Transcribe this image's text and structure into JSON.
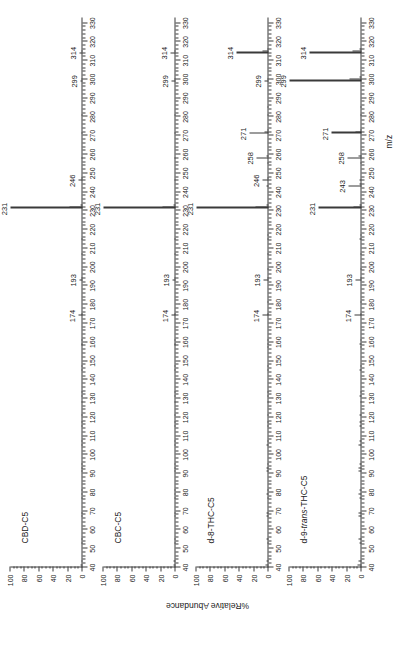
{
  "figure": {
    "axis_y_title": "%Relative Abundance",
    "axis_x_title": "m/z",
    "x_min": 40,
    "x_max": 333,
    "y_min": 0,
    "y_max": 100,
    "x_major_ticks": [
      40,
      50,
      60,
      70,
      80,
      90,
      100,
      110,
      120,
      130,
      140,
      150,
      160,
      170,
      180,
      190,
      200,
      210,
      220,
      230,
      240,
      250,
      260,
      270,
      280,
      290,
      300,
      310,
      320,
      330
    ],
    "y_major_ticks": [
      0,
      20,
      40,
      60,
      80,
      100
    ],
    "ink_color": "#3a3a3a"
  },
  "chart_data": [
    {
      "type": "bar",
      "title": "CBD-C5",
      "xlabel": "m/z",
      "ylabel": "%Relative Abundance",
      "xlim": [
        40,
        333
      ],
      "ylim": [
        0,
        100
      ],
      "grid": false,
      "legend": "none",
      "labeled_peaks": [
        174,
        193,
        231,
        246,
        299,
        314
      ],
      "x": [
        41,
        43,
        53,
        55,
        67,
        69,
        77,
        79,
        81,
        91,
        93,
        95,
        105,
        107,
        115,
        117,
        121,
        128,
        131,
        133,
        145,
        147,
        158,
        159,
        161,
        174,
        175,
        193,
        194,
        207,
        215,
        231,
        232,
        233,
        246,
        247,
        258,
        271,
        281,
        299,
        300,
        314,
        315
      ],
      "y": [
        2.5,
        2.0,
        1.2,
        1.5,
        1.2,
        1.5,
        1.0,
        1.2,
        1.0,
        1.4,
        1.2,
        1.0,
        1.2,
        1.0,
        1.0,
        0.9,
        0.9,
        0.8,
        0.9,
        0.8,
        0.9,
        0.8,
        0.8,
        0.9,
        0.8,
        5.0,
        1.0,
        4.0,
        0.8,
        0.9,
        0.8,
        100,
        18,
        2.5,
        6.0,
        1.0,
        0.8,
        0.9,
        0.8,
        3.0,
        0.8,
        4.5,
        0.8
      ]
    },
    {
      "type": "bar",
      "title": "CBC-C5",
      "xlabel": "m/z",
      "ylabel": "%Relative Abundance",
      "xlim": [
        40,
        333
      ],
      "ylim": [
        0,
        100
      ],
      "grid": false,
      "legend": "none",
      "labeled_peaks": [
        174,
        193,
        231,
        299,
        314
      ],
      "x": [
        41,
        43,
        53,
        55,
        67,
        69,
        77,
        79,
        81,
        91,
        93,
        95,
        105,
        107,
        115,
        117,
        121,
        128,
        131,
        133,
        145,
        147,
        158,
        159,
        161,
        174,
        175,
        193,
        194,
        207,
        215,
        231,
        232,
        233,
        246,
        258,
        271,
        281,
        299,
        300,
        314,
        315
      ],
      "y": [
        2.5,
        2.2,
        1.2,
        1.5,
        1.2,
        1.5,
        1.0,
        1.2,
        1.0,
        1.4,
        1.2,
        1.0,
        1.2,
        1.0,
        1.0,
        0.9,
        0.9,
        0.8,
        0.9,
        0.8,
        0.9,
        0.8,
        0.8,
        0.9,
        0.8,
        5.5,
        1.0,
        4.5,
        0.8,
        0.9,
        0.8,
        100,
        18,
        2.5,
        1.0,
        0.9,
        1.0,
        0.8,
        5.0,
        1.0,
        7.0,
        1.0
      ]
    },
    {
      "type": "bar",
      "title": "d-8-THC-C5",
      "xlabel": "m/z",
      "ylabel": "%Relative Abundance",
      "xlim": [
        40,
        333
      ],
      "ylim": [
        0,
        100
      ],
      "grid": false,
      "legend": "none",
      "labeled_peaks": [
        174,
        193,
        231,
        246,
        258,
        271,
        299,
        314
      ],
      "x": [
        41,
        43,
        53,
        55,
        67,
        69,
        77,
        79,
        81,
        91,
        93,
        95,
        105,
        107,
        115,
        117,
        121,
        128,
        131,
        133,
        145,
        147,
        157,
        159,
        161,
        174,
        175,
        181,
        193,
        194,
        199,
        207,
        215,
        217,
        231,
        232,
        233,
        243,
        246,
        247,
        255,
        258,
        259,
        271,
        272,
        273,
        281,
        285,
        299,
        300,
        314,
        315,
        316
      ],
      "y": [
        3.5,
        3.0,
        2.0,
        2.5,
        2.5,
        3.0,
        2.0,
        2.5,
        2.0,
        3.0,
        2.5,
        2.0,
        2.5,
        2.0,
        2.0,
        1.8,
        1.8,
        1.5,
        1.8,
        1.5,
        1.8,
        1.5,
        1.5,
        2.0,
        1.5,
        8.0,
        1.5,
        1.5,
        6.5,
        1.2,
        1.2,
        1.5,
        1.5,
        1.2,
        100,
        18,
        3.0,
        2.5,
        8.0,
        1.5,
        1.5,
        16,
        2.5,
        27,
        5.0,
        1.5,
        1.5,
        1.2,
        6.0,
        1.2,
        45,
        8.0,
        1.5
      ]
    },
    {
      "type": "bar",
      "title": "d-9-trans-THC-C5",
      "title_italic_part": "trans",
      "xlabel": "m/z",
      "ylabel": "%Relative Abundance",
      "xlim": [
        40,
        333
      ],
      "ylim": [
        0,
        100
      ],
      "grid": false,
      "legend": "none",
      "labeled_peaks": [
        174,
        193,
        231,
        243,
        258,
        271,
        299,
        314
      ],
      "x": [
        41,
        43,
        53,
        55,
        67,
        69,
        77,
        79,
        81,
        91,
        93,
        95,
        105,
        107,
        115,
        117,
        121,
        128,
        131,
        133,
        145,
        147,
        157,
        159,
        161,
        174,
        175,
        181,
        193,
        194,
        199,
        207,
        215,
        217,
        231,
        232,
        233,
        243,
        244,
        246,
        255,
        258,
        259,
        271,
        272,
        273,
        281,
        285,
        299,
        300,
        301,
        314,
        315,
        316
      ],
      "y": [
        5.0,
        4.5,
        3.0,
        3.5,
        3.5,
        4.0,
        3.0,
        3.5,
        3.0,
        4.0,
        3.5,
        3.0,
        3.5,
        3.0,
        3.0,
        2.5,
        2.5,
        2.0,
        2.5,
        2.0,
        2.5,
        2.0,
        2.0,
        3.0,
        2.0,
        10,
        2.0,
        2.0,
        8.0,
        1.5,
        1.5,
        2.0,
        2.5,
        1.5,
        60,
        11,
        2.5,
        18,
        3.0,
        2.5,
        2.0,
        20,
        3.5,
        42,
        8.0,
        2.0,
        2.0,
        1.5,
        100,
        17,
        3.0,
        72,
        13,
        2.5
      ]
    }
  ]
}
